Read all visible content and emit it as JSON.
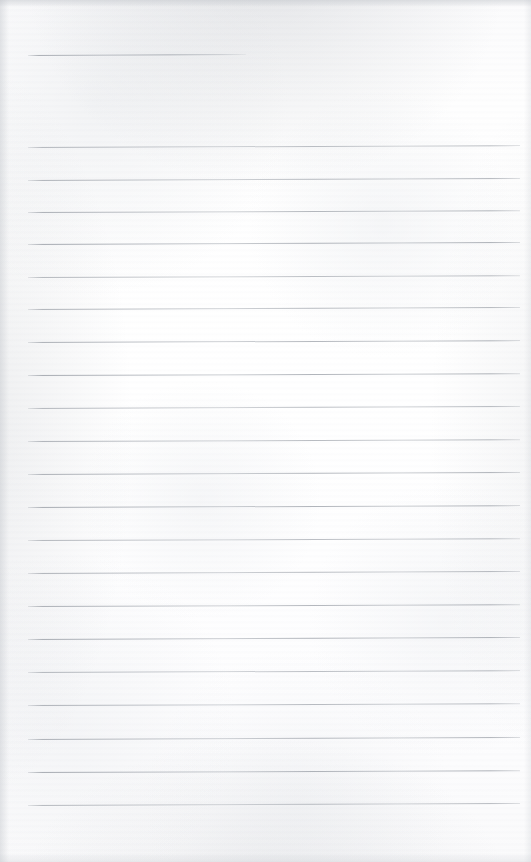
{
  "document": {
    "type": "scanned-lined-paper",
    "title": "Blank lined notebook page",
    "width": 531,
    "height": 862,
    "page_background_color": "#fdfdfd",
    "rule_color": "#9aa0a8",
    "text_content": "",
    "has_handwriting": false,
    "has_printed_text": false
  },
  "rules": {
    "left_x": 28,
    "right_x": 520,
    "count_full": 21,
    "spacing_px": 32.9,
    "first_full_y": 147,
    "last_full_y": 805,
    "header_rule": {
      "name": "header-rule",
      "left_x": 28,
      "right_x": 246,
      "y": 55,
      "tilt_deg": -0.25
    },
    "lines": [
      {
        "y": 147.0,
        "tilt_deg": -0.22
      },
      {
        "y": 179.5,
        "tilt_deg": -0.24
      },
      {
        "y": 211.5,
        "tilt_deg": -0.2
      },
      {
        "y": 243.5,
        "tilt_deg": -0.23
      },
      {
        "y": 276.5,
        "tilt_deg": -0.21
      },
      {
        "y": 309.0,
        "tilt_deg": -0.24
      },
      {
        "y": 342.0,
        "tilt_deg": -0.22
      },
      {
        "y": 375.0,
        "tilt_deg": -0.2
      },
      {
        "y": 408.0,
        "tilt_deg": -0.23
      },
      {
        "y": 441.0,
        "tilt_deg": -0.21
      },
      {
        "y": 474.0,
        "tilt_deg": -0.24
      },
      {
        "y": 507.0,
        "tilt_deg": -0.22
      },
      {
        "y": 540.0,
        "tilt_deg": -0.2
      },
      {
        "y": 573.0,
        "tilt_deg": -0.23
      },
      {
        "y": 606.0,
        "tilt_deg": -0.21
      },
      {
        "y": 639.0,
        "tilt_deg": -0.24
      },
      {
        "y": 672.0,
        "tilt_deg": -0.22
      },
      {
        "y": 705.0,
        "tilt_deg": -0.2
      },
      {
        "y": 739.0,
        "tilt_deg": -0.23
      },
      {
        "y": 772.0,
        "tilt_deg": -0.21
      },
      {
        "y": 805.0,
        "tilt_deg": -0.24
      }
    ]
  }
}
